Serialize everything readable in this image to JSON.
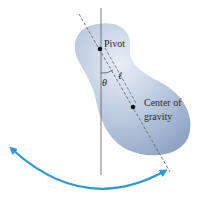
{
  "diagram": {
    "type": "physical-pendulum",
    "labels": {
      "pivot": "Pivot",
      "center_of_gravity_line1": "Center of",
      "center_of_gravity_line2": "gravity",
      "theta": "θ",
      "length": "ℓ"
    },
    "colors": {
      "body_light": "#dfe8f4",
      "body_dark": "#8fa6c8",
      "arrow": "#2a9ad6",
      "line": "#555555",
      "dot": "#111111"
    }
  }
}
